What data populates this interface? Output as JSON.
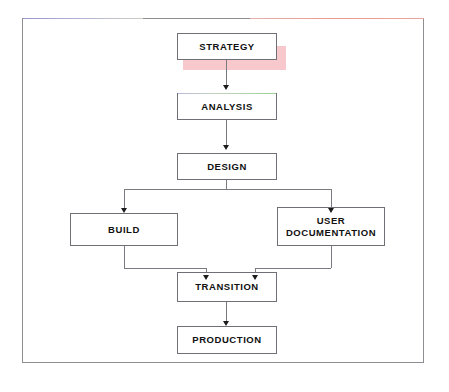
{
  "diagram": {
    "background_color": "#ffffff",
    "frame_border_color": "#8d8d92",
    "node_border_color": "#6f7075",
    "node_fill_color": "#ffffff",
    "connector_color": "#7a7b80",
    "arrow_color": "#1b1b1b",
    "highlight_shadow_color": "#f7c9cc",
    "nodes": [
      {
        "id": "strategy",
        "label": "STRATEGY",
        "line2": "",
        "highlighted": "true"
      },
      {
        "id": "analysis",
        "label": "ANALYSIS",
        "line2": "",
        "highlighted": "false"
      },
      {
        "id": "design",
        "label": "DESIGN",
        "line2": "",
        "highlighted": "false"
      },
      {
        "id": "build",
        "label": "BUILD",
        "line2": "",
        "highlighted": "false"
      },
      {
        "id": "documentation",
        "label": "USER",
        "line2": "DOCUMENTATION",
        "highlighted": "false"
      },
      {
        "id": "transition",
        "label": "TRANSITION",
        "line2": "",
        "highlighted": "false"
      },
      {
        "id": "production",
        "label": "PRODUCTION",
        "line2": "",
        "highlighted": "false"
      }
    ],
    "edges": [
      {
        "from": "strategy",
        "to": "analysis"
      },
      {
        "from": "analysis",
        "to": "design"
      },
      {
        "from": "design",
        "to": "build"
      },
      {
        "from": "design",
        "to": "documentation"
      },
      {
        "from": "build",
        "to": "transition"
      },
      {
        "from": "documentation",
        "to": "transition"
      },
      {
        "from": "transition",
        "to": "production"
      }
    ]
  }
}
